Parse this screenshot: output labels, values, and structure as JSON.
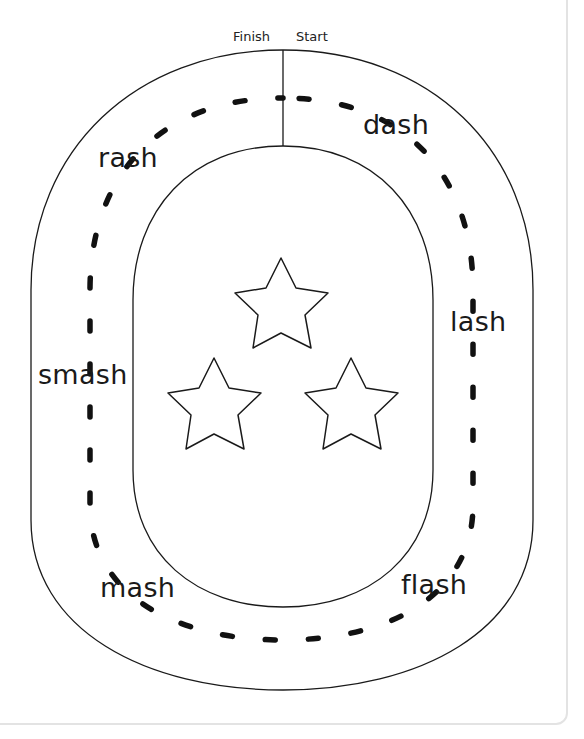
{
  "worksheet": {
    "markers": {
      "finish": "Finish",
      "start": "Start"
    },
    "words": [
      {
        "id": "dash",
        "text": "dash"
      },
      {
        "id": "lash",
        "text": "lash"
      },
      {
        "id": "flash",
        "text": "flash"
      },
      {
        "id": "mash",
        "text": "mash"
      },
      {
        "id": "smash",
        "text": "smash"
      },
      {
        "id": "rash",
        "text": "rash"
      }
    ],
    "decorations": {
      "stars": 3,
      "star_icon": "star-outline-icon"
    },
    "colors": {
      "line": "#1a1a1a",
      "card_border": "#e3e3e3",
      "background": "#ffffff"
    }
  }
}
